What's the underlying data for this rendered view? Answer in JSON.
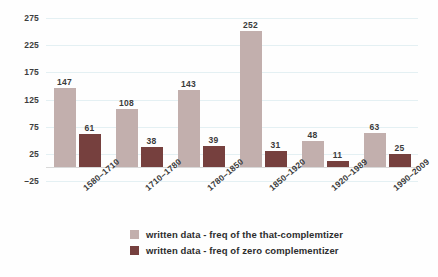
{
  "chart_data": {
    "type": "bar",
    "title": "",
    "subtitle": "",
    "xlabel": "",
    "ylabel": "",
    "categories": [
      "1580–1710",
      "1710–1780",
      "1780–1850",
      "1850–1920",
      "1920–1989",
      "1990–2009"
    ],
    "series": [
      {
        "name": "written data - freq of the that-complemtizer",
        "color": "#c2afad",
        "values": [
          147,
          108,
          143,
          252,
          48,
          63
        ]
      },
      {
        "name": "written data - freq of zero complementizer",
        "color": "#76403e",
        "values": [
          61,
          38,
          39,
          31,
          11,
          25
        ]
      }
    ],
    "yticks": [
      275,
      225,
      175,
      125,
      75,
      25,
      -25
    ],
    "ytick_labels": [
      "275",
      "225",
      "175",
      "125",
      "75",
      "25",
      "–25"
    ],
    "ylim": [
      -25,
      275
    ],
    "grid": true,
    "grid_color": "#e4f0f3",
    "baseline_color": "#d9d9d9",
    "legend_position": "bottom",
    "data_labels": true,
    "background": "#ffffff"
  },
  "legend": {
    "items": [
      {
        "label": "written data - freq of the that-complemtizer",
        "color": "#c2afad"
      },
      {
        "label": "written data - freq of zero complementizer",
        "color": "#76403e"
      }
    ]
  }
}
